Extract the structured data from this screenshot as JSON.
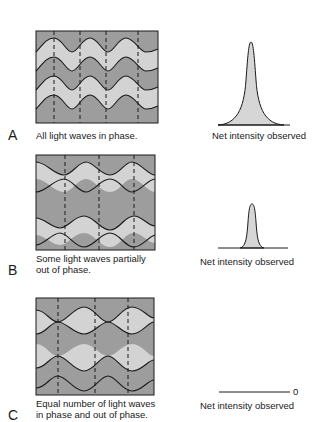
{
  "colors": {
    "dark_band": "#9d9d9d",
    "light_band": "#d3d3d3",
    "wave_line": "#1a1a1a",
    "peak_fill": "#d6d6d6"
  },
  "panels": [
    {
      "letter": "A",
      "caption_lines": [
        "All light waves in phase."
      ],
      "intensity_label": "Net intensity observed",
      "intensity": "high"
    },
    {
      "letter": "B",
      "caption_lines": [
        "Some light waves partially",
        "out of phase."
      ],
      "intensity_label": "Net intensity observed",
      "intensity": "medium"
    },
    {
      "letter": "C",
      "caption_lines": [
        "Equal number of light waves",
        "in phase and out of phase."
      ],
      "intensity_label": "Net intensity observed",
      "intensity": "zero",
      "zero_label": "0"
    }
  ]
}
